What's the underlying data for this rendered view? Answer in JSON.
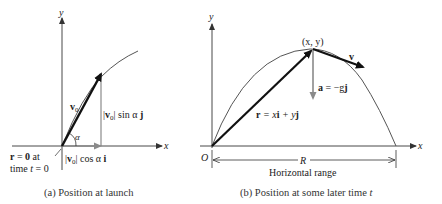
{
  "panel_a": {
    "caption": "(a)  Position at launch",
    "axis_x": "x",
    "axis_y": "y",
    "v0_label": "v",
    "v0_sub": "0",
    "angle_label": "α",
    "sin_component": {
      "bar_l": "|",
      "v": "v",
      "sub": "0",
      "bar_r": "|",
      "rest": " sin α ",
      "unit": "j"
    },
    "cos_component": {
      "bar_l": "|",
      "v": "v",
      "sub": "0",
      "bar_r": "|",
      "rest": " cos α ",
      "unit": "i"
    },
    "origin_note_line1": {
      "r": "r",
      "eq": " = ",
      "zero": "0",
      "rest": " at"
    },
    "origin_note_line2": {
      "pre": "time ",
      "t": "t",
      "post": " = 0"
    }
  },
  "panel_b": {
    "caption_pre": "(b)  Position at some later time ",
    "caption_t": "t",
    "axis_x": "x",
    "axis_y": "y",
    "origin": "O",
    "point_label": "(x, y)",
    "velocity_label": "v",
    "accel_label": {
      "a": "a",
      "mid": " = −g",
      "j": "j"
    },
    "position_label": {
      "r": "r",
      "eq": " = x",
      "i": "i",
      "plus": " + y",
      "j": "j"
    },
    "range_symbol": "R",
    "range_label": "Horizontal range"
  },
  "colors": {
    "axis": "#333333",
    "vector_dark": "#111111",
    "vector_gray": "#8a8a8a",
    "curve": "#555555"
  }
}
